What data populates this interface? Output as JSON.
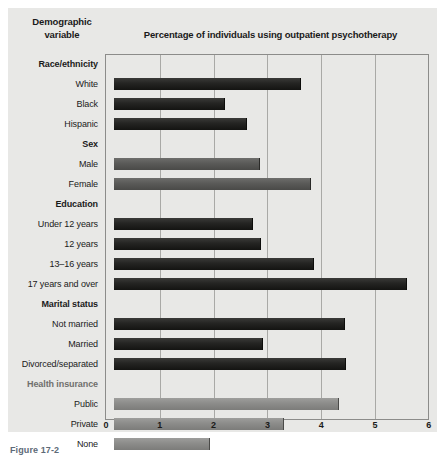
{
  "figure": {
    "column_header_left": "Demographic\nvariable",
    "column_header_left_line1": "Demographic",
    "column_header_left_line2": "variable",
    "chart_title": "Percentage of individuals using outpatient psychotherapy",
    "caption": "Figure 17-2"
  },
  "chart_data": {
    "type": "bar",
    "orientation": "horizontal",
    "title": "Percentage of individuals using outpatient psychotherapy",
    "xlabel": "",
    "ylabel": "Demographic variable",
    "xlim": [
      0,
      6
    ],
    "xticks": [
      "0",
      "1",
      "2",
      "3",
      "4",
      "5",
      "6"
    ],
    "grid": true,
    "legend": "none",
    "groups": [
      {
        "name": "Race/ethnicity",
        "style": "dark",
        "categories": [
          "White",
          "Black",
          "Hispanic"
        ],
        "values": [
          3.46,
          2.04,
          2.46
        ]
      },
      {
        "name": "Sex",
        "style": "mid",
        "categories": [
          "Male",
          "Female"
        ],
        "values": [
          2.69,
          3.65
        ]
      },
      {
        "name": "Education",
        "style": "dark",
        "categories": [
          "Under 12 years",
          "12 years",
          "13–16 years",
          "17 years and over"
        ],
        "values": [
          2.57,
          2.72,
          3.7,
          5.43
        ]
      },
      {
        "name": "Marital status",
        "style": "dark",
        "categories": [
          "Not married",
          "Married",
          "Divorced/separated"
        ],
        "values": [
          4.28,
          2.76,
          4.3
        ]
      },
      {
        "name": "Health insurance",
        "style": "lightgray",
        "categories": [
          "Public",
          "Private",
          "None"
        ],
        "values": [
          4.17,
          3.15,
          1.76
        ]
      }
    ]
  }
}
